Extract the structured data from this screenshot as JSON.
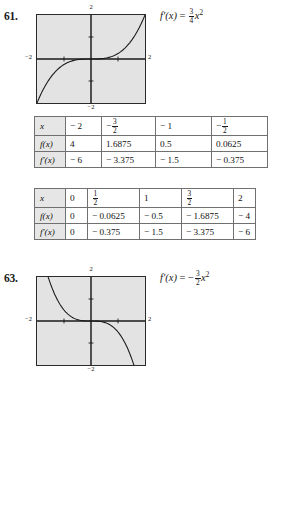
{
  "page": {
    "problems": [
      {
        "number": "61.",
        "formula": {
          "lhs": "f'(x)",
          "eq": "=",
          "sign": "",
          "frac_num": "3",
          "frac_den": "4",
          "var": "x",
          "exp": "2",
          "plain": "f'(x) = 3/4 x^2"
        },
        "graph": {
          "x_min_label": "-2",
          "x_max_label": "2",
          "y_min_label": "-2",
          "y_max_label": "2",
          "curve_desc": "increasing-cubic"
        },
        "tables": [
          {
            "rows": [
              {
                "label": "x",
                "values": [
                  "-2",
                  "FRAC:-3/2",
                  "-1",
                  "FRAC:-1/2"
                ]
              },
              {
                "label": "f(x)",
                "values": [
                  "-2",
                  "-0.8438",
                  "-0.25",
                  "-0.0313"
                ]
              },
              {
                "label": "f'(x)",
                "values": [
                  "3",
                  "1.6875",
                  "0.75",
                  "0.1875"
                ]
              }
            ]
          },
          {
            "rows": [
              {
                "label": "x",
                "values": [
                  "0",
                  "FRAC:1/2",
                  "1",
                  "FRAC:3/2",
                  "2"
                ]
              },
              {
                "label": "f(x)",
                "values": [
                  "0",
                  "0.0313",
                  "0.25",
                  "0.8438",
                  "2"
                ]
              },
              {
                "label": "f'(x)",
                "values": [
                  "0",
                  "0.1875",
                  "0.75",
                  "1.6875",
                  "3"
                ]
              }
            ]
          }
        ]
      },
      {
        "number": "63.",
        "formula": {
          "lhs": "f'(x)",
          "eq": "=",
          "sign": "-",
          "frac_num": "3",
          "frac_den": "2",
          "var": "x",
          "exp": "2",
          "plain": "f'(x) = -3/2 x^2"
        },
        "graph": {
          "x_min_label": "-2",
          "x_max_label": "2",
          "y_min_label": "-2",
          "y_max_label": "2",
          "curve_desc": "decreasing-cubic"
        },
        "tables": [
          {
            "rows": [
              {
                "label": "x",
                "values": [
                  "-2",
                  "FRAC:-3/2",
                  "-1",
                  "FRAC:-1/2"
                ]
              },
              {
                "label": "f(x)",
                "values": [
                  "4",
                  "1.6875",
                  "0.5",
                  "0.0625"
                ]
              },
              {
                "label": "f'(x)",
                "values": [
                  "-6",
                  "-3.375",
                  "-1.5",
                  "-0.375"
                ]
              }
            ]
          },
          {
            "rows": [
              {
                "label": "x",
                "values": [
                  "0",
                  "FRAC:1/2",
                  "1",
                  "FRAC:3/2",
                  "2"
                ]
              },
              {
                "label": "f(x)",
                "values": [
                  "0",
                  "-0.0625",
                  "-0.5",
                  "-1.6875",
                  "-4"
                ]
              },
              {
                "label": "f'(x)",
                "values": [
                  "0",
                  "-0.375",
                  "-1.5",
                  "-3.375",
                  "-6"
                ]
              }
            ]
          }
        ]
      }
    ]
  },
  "colors": {
    "plot_background": "#e3e3e3",
    "plot_border": "#2a2a2a",
    "table_border": "#707070",
    "row_label_background": "#e6e6e6",
    "curve": "#1a1a1a"
  }
}
